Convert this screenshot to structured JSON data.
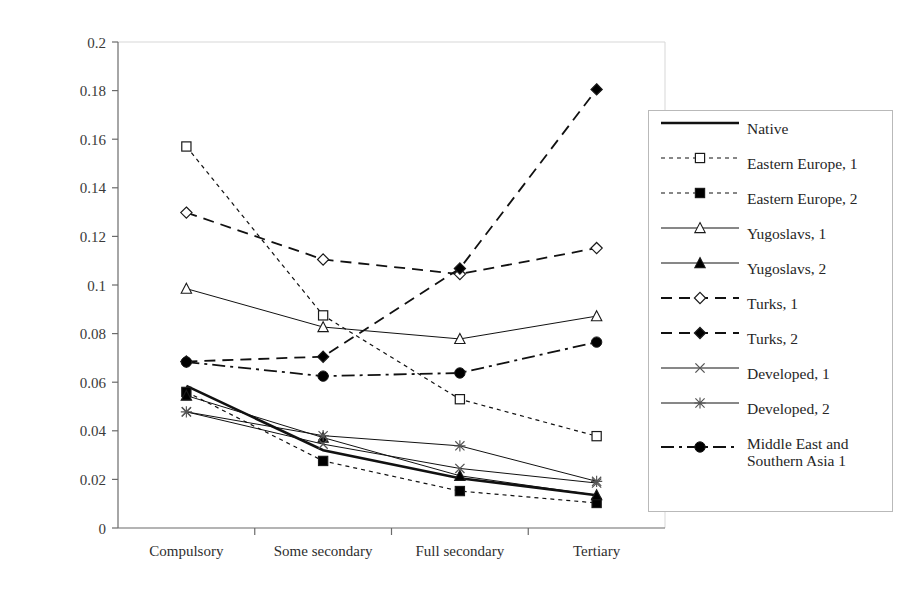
{
  "chart_data": {
    "type": "line",
    "title": "",
    "xlabel": "",
    "ylabel": "",
    "categories": [
      "Compulsory",
      "Some secondary",
      "Full secondary",
      "Tertiary"
    ],
    "ylim": [
      0,
      0.2
    ],
    "ytick_step": 0.02,
    "yticks": [
      "0",
      "0.02",
      "0.04",
      "0.06",
      "0.08",
      "0.1",
      "0.12",
      "0.14",
      "0.16",
      "0.18",
      "0.2"
    ],
    "grid": false,
    "legend_position": "right",
    "series": [
      {
        "name": "Native",
        "values": [
          0.0585,
          0.032,
          0.0205,
          0.0135
        ],
        "marker": "none",
        "dash": "solid",
        "width": 2.6,
        "fill": "#000000"
      },
      {
        "name": "Eastern Europe, 1",
        "values": [
          0.157,
          0.0875,
          0.053,
          0.0378
        ],
        "marker": "square-open",
        "dash": "dotted",
        "width": 1.2,
        "fill": "#ffffff"
      },
      {
        "name": "Eastern Europe, 2",
        "values": [
          0.056,
          0.0276,
          0.0152,
          0.0103
        ],
        "marker": "square-filled",
        "dash": "dotted",
        "width": 1.2,
        "fill": "#000000"
      },
      {
        "name": "Yugoslavs, 1",
        "values": [
          0.0985,
          0.0827,
          0.0778,
          0.0872
        ],
        "marker": "triangle-open",
        "dash": "solid",
        "width": 1.0,
        "fill": "#ffffff"
      },
      {
        "name": "Yugoslavs, 2",
        "values": [
          0.0545,
          0.0372,
          0.0215,
          0.0135
        ],
        "marker": "triangle-filled",
        "dash": "solid",
        "width": 1.0,
        "fill": "#000000"
      },
      {
        "name": "Turks, 1",
        "values": [
          0.1298,
          0.1105,
          0.1045,
          0.1152
        ],
        "marker": "diamond-open",
        "dash": "dashed",
        "width": 1.8,
        "fill": "#ffffff"
      },
      {
        "name": "Turks, 2",
        "values": [
          0.0685,
          0.0705,
          0.1068,
          0.1805
        ],
        "marker": "diamond-filled",
        "dash": "dashed",
        "width": 1.8,
        "fill": "#000000"
      },
      {
        "name": "Developed, 1",
        "values": [
          0.0478,
          0.0345,
          0.0245,
          0.0185
        ],
        "marker": "x-cross",
        "dash": "solid",
        "width": 1.0,
        "fill": "#555555"
      },
      {
        "name": "Developed, 2",
        "values": [
          0.0478,
          0.038,
          0.0338,
          0.0192
        ],
        "marker": "asterisk",
        "dash": "solid",
        "width": 1.0,
        "fill": "#555555"
      },
      {
        "name": "Middle East and\nSouthern Asia 1",
        "values": [
          0.0683,
          0.0625,
          0.0638,
          0.0765
        ],
        "marker": "circle-filled",
        "dash": "dashdot",
        "width": 1.8,
        "fill": "#000000"
      }
    ]
  },
  "axis": {
    "y_min_label": "0",
    "y_max_label": "0.2"
  },
  "legend": {
    "items": [
      {
        "label": "Native"
      },
      {
        "label": "Eastern Europe, 1"
      },
      {
        "label": "Eastern Europe, 2"
      },
      {
        "label": "Yugoslavs, 1"
      },
      {
        "label": "Yugoslavs, 2"
      },
      {
        "label": "Turks, 1"
      },
      {
        "label": "Turks, 2"
      },
      {
        "label": "Developed, 1"
      },
      {
        "label": "Developed, 2"
      },
      {
        "label": "Middle East and\nSouthern Asia 1"
      }
    ]
  }
}
